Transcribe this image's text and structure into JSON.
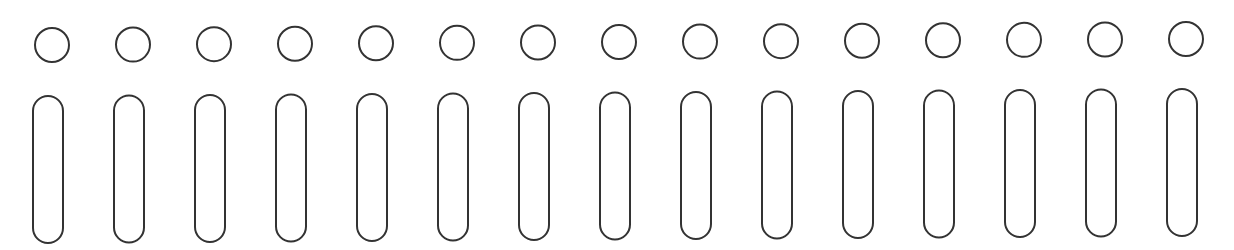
{
  "figure": {
    "background": "#ffffff",
    "stroke_color": "#333333",
    "stroke_width": 2,
    "count": 15,
    "circle": {
      "first_cx": 52,
      "spacing": 81,
      "first_cy": 45,
      "last_cy": 39,
      "r": 17
    },
    "pill": {
      "first_x": 33,
      "width": 30,
      "first_y": 96,
      "last_y": 89,
      "height": 147,
      "corner_radius": 15
    }
  }
}
